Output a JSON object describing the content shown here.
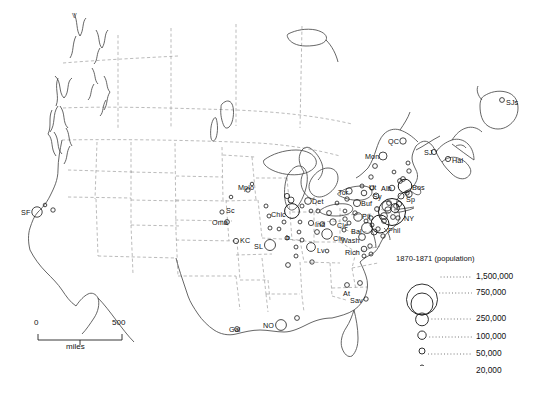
{
  "map": {
    "title": "1870-1871 (population)",
    "region": "North America",
    "projection_note": "United States and Canada city population map",
    "scale_bar": {
      "min": "0",
      "max": "500",
      "unit": "miles"
    },
    "corner_marker": "V"
  },
  "legend": {
    "title": "1870-1871 (population)",
    "entries": [
      {
        "value": "1,500,000",
        "radius": 15.5
      },
      {
        "value": "750,000",
        "radius": 11.0
      },
      {
        "value": "250,000",
        "radius": 6.4
      },
      {
        "value": "100,000",
        "radius": 4.2
      },
      {
        "value": "50,000",
        "radius": 3.0
      },
      {
        "value": "20,000",
        "radius": 2.0
      }
    ]
  },
  "colors": {
    "coastline": "#4a4a4a",
    "boundary": "#9a9a9a",
    "circle_stroke": "#1a1a1a",
    "text": "#111111",
    "background": "#ffffff"
  },
  "cities": [
    {
      "name": "SF",
      "label": "SF",
      "x": 37,
      "y": 212,
      "r": 5.2,
      "lx": 21,
      "ly": 209
    },
    {
      "name": "SF2",
      "label": "",
      "x": 53,
      "y": 210,
      "r": 2.2,
      "lx": 0,
      "ly": 0
    },
    {
      "name": "Sc",
      "label": "Sc",
      "x": 222,
      "y": 212,
      "r": 2.1,
      "lx": 226,
      "ly": 207
    },
    {
      "name": "Oma",
      "label": "Oma",
      "x": 227,
      "y": 222,
      "r": 2.4,
      "lx": 212,
      "ly": 219
    },
    {
      "name": "KC",
      "label": "KC",
      "x": 236,
      "y": 241,
      "r": 2.6,
      "lx": 240,
      "ly": 237
    },
    {
      "name": "SL",
      "label": "SL",
      "x": 270,
      "y": 245,
      "r": 5.5,
      "lx": 254,
      "ly": 243
    },
    {
      "name": "Mplo",
      "label": "Mplo",
      "x": 248,
      "y": 190,
      "r": 2.2,
      "lx": 238,
      "ly": 184
    },
    {
      "name": "Mplo2",
      "label": "",
      "x": 252,
      "y": 184,
      "r": 1.8,
      "lx": 0,
      "ly": 0
    },
    {
      "name": "Chic",
      "label": "Chic",
      "x": 292,
      "y": 211,
      "r": 7.4,
      "lx": 271,
      "ly": 211
    },
    {
      "name": "Chic2",
      "label": "",
      "x": 291,
      "y": 200,
      "r": 3.0,
      "lx": 0,
      "ly": 0
    },
    {
      "name": "Mil",
      "label": "",
      "x": 287,
      "y": 196,
      "r": 2.6,
      "lx": 0,
      "ly": 0
    },
    {
      "name": "Det",
      "label": "Det",
      "x": 308,
      "y": 201,
      "r": 3.4,
      "lx": 312,
      "ly": 198
    },
    {
      "name": "Det2",
      "label": "",
      "x": 302,
      "y": 206,
      "r": 2.0,
      "lx": 0,
      "ly": 0
    },
    {
      "name": "Ind",
      "label": "Ind",
      "x": 311,
      "y": 223,
      "r": 2.6,
      "lx": 315,
      "ly": 221
    },
    {
      "name": "Cle",
      "label": "Cle",
      "x": 333,
      "y": 222,
      "r": 3.2,
      "lx": 337,
      "ly": 222
    },
    {
      "name": "Cle2",
      "label": "",
      "x": 345,
      "y": 219,
      "r": 2.2,
      "lx": 0,
      "ly": 0
    },
    {
      "name": "Cin",
      "label": "Cin",
      "x": 327,
      "y": 234,
      "r": 5.2,
      "lx": 333,
      "ly": 235
    },
    {
      "name": "Cin2",
      "label": "",
      "x": 317,
      "y": 232,
      "r": 2.4,
      "lx": 0,
      "ly": 0
    },
    {
      "name": "Lv",
      "label": "Lv",
      "x": 311,
      "y": 247,
      "r": 4.4,
      "lx": 317,
      "ly": 247
    },
    {
      "name": "Lv2",
      "label": "",
      "x": 296,
      "y": 247,
      "r": 2.0,
      "lx": 0,
      "ly": 0
    },
    {
      "name": "b",
      "label": "b",
      "x": 287,
      "y": 238,
      "r": 2.0,
      "lx": 286,
      "ly": 234
    },
    {
      "name": "Pit",
      "label": "Pit",
      "x": 358,
      "y": 217,
      "r": 4.2,
      "lx": 362,
      "ly": 213
    },
    {
      "name": "Buf",
      "label": "Buf",
      "x": 357,
      "y": 203,
      "r": 3.6,
      "lx": 361,
      "ly": 200
    },
    {
      "name": "Tor",
      "label": "Tor",
      "x": 349,
      "y": 191,
      "r": 3.2,
      "lx": 338,
      "ly": 189
    },
    {
      "name": "Sy",
      "label": "Sy",
      "x": 376,
      "y": 196,
      "r": 3.0,
      "lx": 373,
      "ly": 193
    },
    {
      "name": "Ut",
      "label": "Ut",
      "x": 372,
      "y": 188,
      "r": 2.2,
      "lx": 369,
      "ly": 184
    },
    {
      "name": "Alb",
      "label": "Alb",
      "x": 392,
      "y": 188,
      "r": 2.8,
      "lx": 381,
      "ly": 185
    },
    {
      "name": "Bos",
      "label": "Bos",
      "x": 405,
      "y": 186,
      "r": 6.8,
      "lx": 412,
      "ly": 184
    },
    {
      "name": "Sp",
      "label": "Sp",
      "x": 401,
      "y": 196,
      "r": 3.0,
      "lx": 406,
      "ly": 196
    },
    {
      "name": "NY",
      "label": "NY",
      "x": 392,
      "y": 212,
      "r": 13.5,
      "lx": 404,
      "ly": 215
    },
    {
      "name": "NY2",
      "label": "",
      "x": 387,
      "y": 206,
      "r": 5.0,
      "lx": 0,
      "ly": 0
    },
    {
      "name": "NY3",
      "label": "",
      "x": 384,
      "y": 216,
      "r": 3.4,
      "lx": 0,
      "ly": 0
    },
    {
      "name": "Phil",
      "label": "Phil",
      "x": 380,
      "y": 224,
      "r": 9.0,
      "lx": 388,
      "ly": 227
    },
    {
      "name": "Bal",
      "label": "Bal",
      "x": 367,
      "y": 228,
      "r": 5.4,
      "lx": 351,
      "ly": 228
    },
    {
      "name": "Bal2",
      "label": "",
      "x": 374,
      "y": 232,
      "r": 3.0,
      "lx": 0,
      "ly": 0
    },
    {
      "name": "Wash",
      "label": "Wash",
      "x": 362,
      "y": 237,
      "r": 3.4,
      "lx": 341,
      "ly": 237
    },
    {
      "name": "Rich",
      "label": "Rich",
      "x": 364,
      "y": 249,
      "r": 2.8,
      "lx": 345,
      "ly": 249
    },
    {
      "name": "Rich2",
      "label": "",
      "x": 371,
      "y": 254,
      "r": 2.0,
      "lx": 0,
      "ly": 0
    },
    {
      "name": "QC",
      "label": "QC",
      "x": 403,
      "y": 141,
      "r": 3.2,
      "lx": 388,
      "ly": 138
    },
    {
      "name": "Mon",
      "label": "Mon",
      "x": 383,
      "y": 156,
      "r": 4.0,
      "lx": 365,
      "ly": 153
    },
    {
      "name": "Mon2",
      "label": "",
      "x": 375,
      "y": 166,
      "r": 2.4,
      "lx": 0,
      "ly": 0
    },
    {
      "name": "SJ",
      "label": "SJ",
      "x": 434,
      "y": 152,
      "r": 2.6,
      "lx": 424,
      "ly": 149
    },
    {
      "name": "Hal",
      "label": "Hal",
      "x": 448,
      "y": 159,
      "r": 2.6,
      "lx": 452,
      "ly": 157
    },
    {
      "name": "SJs",
      "label": "SJs",
      "x": 502,
      "y": 100,
      "r": 2.4,
      "lx": 506,
      "ly": 99
    },
    {
      "name": "At",
      "label": "At",
      "x": 347,
      "y": 285,
      "r": 2.4,
      "lx": 343,
      "ly": 290
    },
    {
      "name": "Sav",
      "label": "Sav",
      "x": 366,
      "y": 299,
      "r": 2.2,
      "lx": 350,
      "ly": 297
    },
    {
      "name": "Mob",
      "label": "",
      "x": 297,
      "y": 318,
      "r": 2.4,
      "lx": 0,
      "ly": 0
    },
    {
      "name": "NO",
      "label": "NO",
      "x": 281,
      "y": 325,
      "r": 5.4,
      "lx": 263,
      "ly": 322
    },
    {
      "name": "Gal",
      "label": "Gal",
      "x": 237,
      "y": 329,
      "r": 2.4,
      "lx": 229,
      "ly": 326
    },
    {
      "name": "Nash",
      "label": "",
      "x": 312,
      "y": 262,
      "r": 2.2,
      "lx": 0,
      "ly": 0
    },
    {
      "name": "Memp",
      "label": "",
      "x": 288,
      "y": 265,
      "r": 2.4,
      "lx": 0,
      "ly": 0
    },
    {
      "name": "Col",
      "label": "",
      "x": 329,
      "y": 213,
      "r": 2.4,
      "lx": 0,
      "ly": 0
    },
    {
      "name": "Day",
      "label": "",
      "x": 322,
      "y": 224,
      "r": 2.2,
      "lx": 0,
      "ly": 0
    },
    {
      "name": "Tol",
      "label": "",
      "x": 318,
      "y": 211,
      "r": 2.0,
      "lx": 0,
      "ly": 0
    },
    {
      "name": "Rch",
      "label": "",
      "x": 300,
      "y": 222,
      "r": 1.9,
      "lx": 0,
      "ly": 0
    },
    {
      "name": "Peo",
      "label": "",
      "x": 284,
      "y": 222,
      "r": 2.0,
      "lx": 0,
      "ly": 0
    },
    {
      "name": "Qui",
      "label": "",
      "x": 270,
      "y": 228,
      "r": 2.0,
      "lx": 0,
      "ly": 0
    },
    {
      "name": "Dav",
      "label": "",
      "x": 269,
      "y": 216,
      "r": 2.0,
      "lx": 0,
      "ly": 0
    },
    {
      "name": "Evan",
      "label": "",
      "x": 302,
      "y": 240,
      "r": 2.0,
      "lx": 0,
      "ly": 0
    },
    {
      "name": "Ft",
      "label": "",
      "x": 311,
      "y": 211,
      "r": 1.9,
      "lx": 0,
      "ly": 0
    },
    {
      "name": "Wil",
      "label": "",
      "x": 383,
      "y": 236,
      "r": 2.2,
      "lx": 0,
      "ly": 0
    },
    {
      "name": "Hart",
      "label": "",
      "x": 399,
      "y": 204,
      "r": 2.6,
      "lx": 0,
      "ly": 0
    },
    {
      "name": "Prov",
      "label": "",
      "x": 409,
      "y": 194,
      "r": 3.2,
      "lx": 0,
      "ly": 0
    },
    {
      "name": "NH",
      "label": "",
      "x": 396,
      "y": 206,
      "r": 2.4,
      "lx": 0,
      "ly": 0
    },
    {
      "name": "Law",
      "label": "",
      "x": 403,
      "y": 179,
      "r": 2.4,
      "lx": 0,
      "ly": 0
    },
    {
      "name": "Port",
      "label": "",
      "x": 409,
      "y": 171,
      "r": 2.2,
      "lx": 0,
      "ly": 0
    },
    {
      "name": "Tren",
      "label": "",
      "x": 384,
      "y": 221,
      "r": 2.4,
      "lx": 0,
      "ly": 0
    },
    {
      "name": "Read",
      "label": "",
      "x": 371,
      "y": 218,
      "r": 2.2,
      "lx": 0,
      "ly": 0
    },
    {
      "name": "Harr",
      "label": "",
      "x": 366,
      "y": 221,
      "r": 2.0,
      "lx": 0,
      "ly": 0
    },
    {
      "name": "Nor",
      "label": "",
      "x": 370,
      "y": 246,
      "r": 2.2,
      "lx": 0,
      "ly": 0
    },
    {
      "name": "Chas",
      "label": "",
      "x": 360,
      "y": 283,
      "r": 2.4,
      "lx": 0,
      "ly": 0
    },
    {
      "name": "Pat",
      "label": "",
      "x": 389,
      "y": 203,
      "r": 2.4,
      "lx": 0,
      "ly": 0
    },
    {
      "name": "Ely",
      "label": "",
      "x": 398,
      "y": 218,
      "r": 2.2,
      "lx": 0,
      "ly": 0
    },
    {
      "name": "Ott",
      "label": "",
      "x": 371,
      "y": 177,
      "r": 2.2,
      "lx": 0,
      "ly": 0
    },
    {
      "name": "Ham",
      "label": "",
      "x": 347,
      "y": 199,
      "r": 2.2,
      "lx": 0,
      "ly": 0
    },
    {
      "name": "Lon",
      "label": "",
      "x": 337,
      "y": 203,
      "r": 1.9,
      "lx": 0,
      "ly": 0
    },
    {
      "name": "Alt",
      "label": "",
      "x": 349,
      "y": 223,
      "r": 2.0,
      "lx": 0,
      "ly": 0
    },
    {
      "name": "Whl",
      "label": "",
      "x": 344,
      "y": 230,
      "r": 2.0,
      "lx": 0,
      "ly": 0
    },
    {
      "name": "Lex",
      "label": "",
      "x": 327,
      "y": 251,
      "r": 1.9,
      "lx": 0,
      "ly": 0
    },
    {
      "name": "Spf",
      "label": "",
      "x": 279,
      "y": 229,
      "r": 1.9,
      "lx": 0,
      "ly": 0
    },
    {
      "name": "Terre",
      "label": "",
      "x": 299,
      "y": 232,
      "r": 1.9,
      "lx": 0,
      "ly": 0
    },
    {
      "name": "Mil2",
      "label": "",
      "x": 296,
      "y": 256,
      "r": 2.0,
      "lx": 0,
      "ly": 0
    },
    {
      "name": "Aug",
      "label": "",
      "x": 408,
      "y": 163,
      "r": 2.0,
      "lx": 0,
      "ly": 0
    },
    {
      "name": "NB",
      "label": "",
      "x": 393,
      "y": 217,
      "r": 2.4,
      "lx": 0,
      "ly": 0
    },
    {
      "name": "Cam",
      "label": "",
      "x": 378,
      "y": 229,
      "r": 2.2,
      "lx": 0,
      "ly": 0
    },
    {
      "name": "Sac",
      "label": "",
      "x": 45,
      "y": 205,
      "r": 1.8,
      "lx": 0,
      "ly": 0
    },
    {
      "name": "Dub",
      "label": "",
      "x": 266,
      "y": 206,
      "r": 2.0,
      "lx": 0,
      "ly": 0
    },
    {
      "name": "Burl",
      "label": "",
      "x": 394,
      "y": 172,
      "r": 1.9,
      "lx": 0,
      "ly": 0
    },
    {
      "name": "KingsC",
      "label": "",
      "x": 362,
      "y": 186,
      "r": 2.0,
      "lx": 0,
      "ly": 0
    },
    {
      "name": "Roch",
      "label": "",
      "x": 364,
      "y": 193,
      "r": 2.8,
      "lx": 0,
      "ly": 0
    },
    {
      "name": "Erie",
      "label": "",
      "x": 345,
      "y": 211,
      "r": 1.9,
      "lx": 0,
      "ly": 0
    },
    {
      "name": "Fall",
      "label": "",
      "x": 407,
      "y": 193,
      "r": 2.2,
      "lx": 0,
      "ly": 0
    },
    {
      "name": "Low",
      "label": "",
      "x": 400,
      "y": 181,
      "r": 2.4,
      "lx": 0,
      "ly": 0
    },
    {
      "name": "Scr",
      "label": "",
      "x": 377,
      "y": 209,
      "r": 2.4,
      "lx": 0,
      "ly": 0
    },
    {
      "name": "Alle",
      "label": "",
      "x": 355,
      "y": 213,
      "r": 2.2,
      "lx": 0,
      "ly": 0
    },
    {
      "name": "Pets",
      "label": "",
      "x": 364,
      "y": 256,
      "r": 2.0,
      "lx": 0,
      "ly": 0
    },
    {
      "name": "Lanc",
      "label": "",
      "x": 372,
      "y": 225,
      "r": 2.0,
      "lx": 0,
      "ly": 0
    },
    {
      "name": "Jer",
      "label": "",
      "x": 388,
      "y": 210,
      "r": 3.2,
      "lx": 0,
      "ly": 0
    },
    {
      "name": "Brk",
      "label": "",
      "x": 395,
      "y": 208,
      "r": 4.4,
      "lx": 0,
      "ly": 0
    },
    {
      "name": "StJ",
      "label": "",
      "x": 231,
      "y": 197,
      "r": 1.8,
      "lx": 0,
      "ly": 0
    }
  ]
}
